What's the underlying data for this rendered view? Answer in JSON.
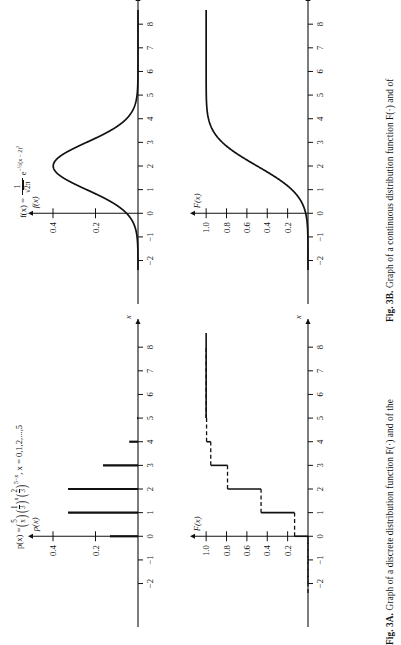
{
  "figures": [
    {
      "id": "fig-3a",
      "caption_lead": "Fig. 3A.",
      "caption_body": "Graph of a discrete distribution function F(·) and of the",
      "upper": {
        "ylabel": "p(x)",
        "xlabel": "x",
        "formula_plain": "p(x) = (5 choose x)(1/3)^x(2/3)^(5-x),  x = 0,1,2,...,5",
        "formula_parts": {
          "lhs": "p(x) =",
          "binom_top": "5",
          "binom_bottom": "x",
          "frac1_num": "1",
          "frac1_den": "3",
          "frac1_exp": "x",
          "frac2_num": "2",
          "frac2_den": "3",
          "frac2_exp": "5−x",
          "domain": ", x = 0,1,2,...,5"
        },
        "y_ticks": [
          0.2,
          0.4
        ],
        "y_tick_labels": [
          "0.2",
          "0.4"
        ],
        "x_ticks": [
          -2,
          -1,
          0,
          1,
          2,
          3,
          4,
          5,
          6,
          7,
          8
        ],
        "x_tick_labels": [
          "−2",
          "−1",
          "0",
          "1",
          "2",
          "3",
          "4",
          "5",
          "6",
          "7",
          "8"
        ]
      },
      "lower": {
        "ylabel": "F(x)",
        "xlabel": "x",
        "y_ticks": [
          0.2,
          0.4,
          0.6,
          0.8,
          1.0
        ],
        "y_tick_labels": [
          "0.2",
          "0.4",
          "0.6",
          "0.8",
          "1.0"
        ],
        "x_ticks": [
          -2,
          -1,
          0,
          1,
          2,
          3,
          4,
          5,
          6,
          7,
          8
        ],
        "x_tick_labels": [
          "−2",
          "−1",
          "0",
          "1",
          "2",
          "3",
          "4",
          "5",
          "6",
          "7",
          "8"
        ]
      }
    },
    {
      "id": "fig-3b",
      "caption_lead": "Fig. 3B.",
      "caption_body": "Graph of a continuous distribution function F(·) and of",
      "upper": {
        "ylabel": "f(x)",
        "xlabel": "x",
        "formula_plain": "f(x) = (1/sqrt(2pi)) e^(-1/2 (x-2)^2)",
        "formula_parts": {
          "lhs": "f(x) =",
          "frac_num": "1",
          "frac_den_radicand": "2π",
          "exp_base": "e",
          "exp_sign": "−",
          "exp_half": "½",
          "exp_body": "(x − 2)",
          "exp_power": "2"
        },
        "y_ticks": [
          0.2,
          0.4
        ],
        "y_tick_labels": [
          "0.2",
          "0.4"
        ],
        "x_ticks": [
          -2,
          -1,
          0,
          1,
          2,
          3,
          4,
          5,
          6,
          7,
          8
        ],
        "x_tick_labels": [
          "−2",
          "−1",
          "0",
          "1",
          "2",
          "3",
          "4",
          "5",
          "6",
          "7",
          "8"
        ]
      },
      "lower": {
        "ylabel": "F(x)",
        "xlabel": "x",
        "y_ticks": [
          0.2,
          0.4,
          0.6,
          0.8,
          1.0
        ],
        "y_tick_labels": [
          "0.2",
          "0.4",
          "0.6",
          "0.8",
          "1.0"
        ],
        "x_ticks": [
          -2,
          -1,
          0,
          1,
          2,
          3,
          4,
          5,
          6,
          7,
          8
        ],
        "x_tick_labels": [
          "−2",
          "−1",
          "0",
          "1",
          "2",
          "3",
          "4",
          "5",
          "6",
          "7",
          "8"
        ]
      }
    }
  ],
  "chart_data": [
    {
      "type": "bar",
      "id": "fig3a-pmf",
      "title": "p(x) = C(5,x)(1/3)^x(2/3)^(5-x), x = 0,1,2,...,5",
      "xlabel": "x",
      "ylabel": "p(x)",
      "categories": [
        0,
        1,
        2,
        3,
        4,
        5
      ],
      "values": [
        0.1317,
        0.3292,
        0.3292,
        0.1646,
        0.0412,
        0.0041
      ],
      "xlim": [
        -2.4,
        8.6
      ],
      "ylim": [
        0,
        0.48
      ],
      "x_ticks": [
        -2,
        -1,
        0,
        1,
        2,
        3,
        4,
        5,
        6,
        7,
        8
      ],
      "y_ticks": [
        0.2,
        0.4
      ],
      "grid": false,
      "legend": "none",
      "note": "vertical spikes (needle plot) of the binomial pmf n=5 p=1/3"
    },
    {
      "type": "line",
      "id": "fig3a-cdf",
      "title": "Discrete distribution function F(x)",
      "xlabel": "x",
      "ylabel": "F(x)",
      "x": [
        -2,
        0,
        1,
        2,
        3,
        4,
        5,
        8
      ],
      "values": [
        0,
        0.1317,
        0.4609,
        0.7901,
        0.9547,
        0.9959,
        1.0,
        1.0
      ],
      "step": "post",
      "xlim": [
        -2.4,
        8.6
      ],
      "ylim": [
        0,
        1.08
      ],
      "x_ticks": [
        -2,
        -1,
        0,
        1,
        2,
        3,
        4,
        5,
        6,
        7,
        8
      ],
      "y_ticks": [
        0.2,
        0.4,
        0.6,
        0.8,
        1.0
      ],
      "grid": false,
      "legend": "none",
      "note": "right-continuous staircase; horizontal treads drawn dashed, risers solid"
    },
    {
      "type": "line",
      "id": "fig3b-pdf",
      "title": "f(x) = 1/sqrt(2pi) e^(-1/2 (x-2)^2)",
      "xlabel": "x",
      "ylabel": "f(x)",
      "xlim": [
        -2.4,
        8.6
      ],
      "ylim": [
        0,
        0.48
      ],
      "x_ticks": [
        -2,
        -1,
        0,
        1,
        2,
        3,
        4,
        5,
        6,
        7,
        8
      ],
      "y_ticks": [
        0.2,
        0.4
      ],
      "peak_x": 2,
      "peak_y": 0.3989,
      "mean": 2,
      "sd": 1,
      "grid": false,
      "legend": "none"
    },
    {
      "type": "line",
      "id": "fig3b-cdf",
      "title": "Continuous distribution function F(x)",
      "xlabel": "x",
      "ylabel": "F(x)",
      "xlim": [
        -2.4,
        8.6
      ],
      "ylim": [
        0,
        1.08
      ],
      "x_ticks": [
        -2,
        -1,
        0,
        1,
        2,
        3,
        4,
        5,
        6,
        7,
        8
      ],
      "y_ticks": [
        0.2,
        0.4,
        0.6,
        0.8,
        1.0
      ],
      "mean": 2,
      "sd": 1,
      "grid": false,
      "legend": "none"
    }
  ],
  "style": {
    "ink": "#111111",
    "paper": "#ffffff"
  }
}
